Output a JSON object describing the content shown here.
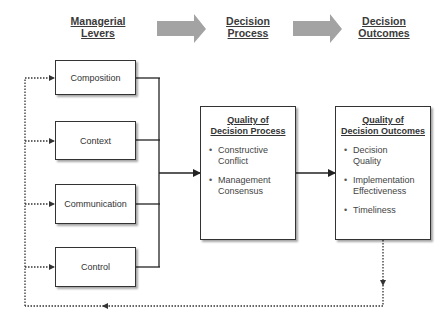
{
  "stages": {
    "levers": {
      "line1": "Managerial",
      "line2": "Levers"
    },
    "process": {
      "line1": "Decision",
      "line2": "Process"
    },
    "outcomes": {
      "line1": "Decision",
      "line2": "Outcomes"
    }
  },
  "levers": [
    {
      "label": "Composition"
    },
    {
      "label": "Context"
    },
    {
      "label": "Communication"
    },
    {
      "label": "Control"
    }
  ],
  "process_box": {
    "title_line1": "Quality of",
    "title_line2": "Decision Process",
    "items": [
      "Constructive Conflict",
      "Management Consensus"
    ]
  },
  "outcomes_box": {
    "title_line1": "Quality of",
    "title_line2": "Decision Outcomes",
    "items": [
      "Decision Quality",
      "Implementation Effectiveness",
      "Timeliness"
    ]
  },
  "colors": {
    "stage_arrow": "#a3a3a3",
    "line": "#222222",
    "feedback": "#333333"
  }
}
